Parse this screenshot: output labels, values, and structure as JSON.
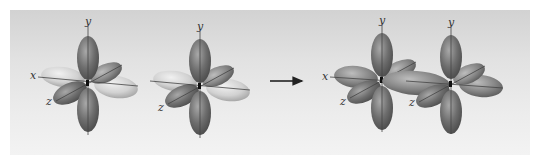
{
  "diagram": {
    "type": "orbital-overlap",
    "colors": {
      "panel_top": "#d2d2d2",
      "panel_bottom": "#f3f3f3",
      "lobe_dark": "#6e6e6e",
      "lobe_light": "#c9c9c9",
      "axis": "#444444",
      "arrow": "#222222"
    },
    "left_group": {
      "orbital_1": {
        "labels": {
          "y": "y",
          "x": "x",
          "z": "z"
        }
      },
      "orbital_2": {
        "labels": {
          "y": "y",
          "z": "z"
        }
      }
    },
    "arrow": {
      "direction": "right"
    },
    "right_group": {
      "orbital_1": {
        "labels": {
          "y": "y",
          "x": "x",
          "z": "z"
        }
      },
      "orbital_2": {
        "labels": {
          "y": "y",
          "z": "z"
        }
      }
    }
  }
}
